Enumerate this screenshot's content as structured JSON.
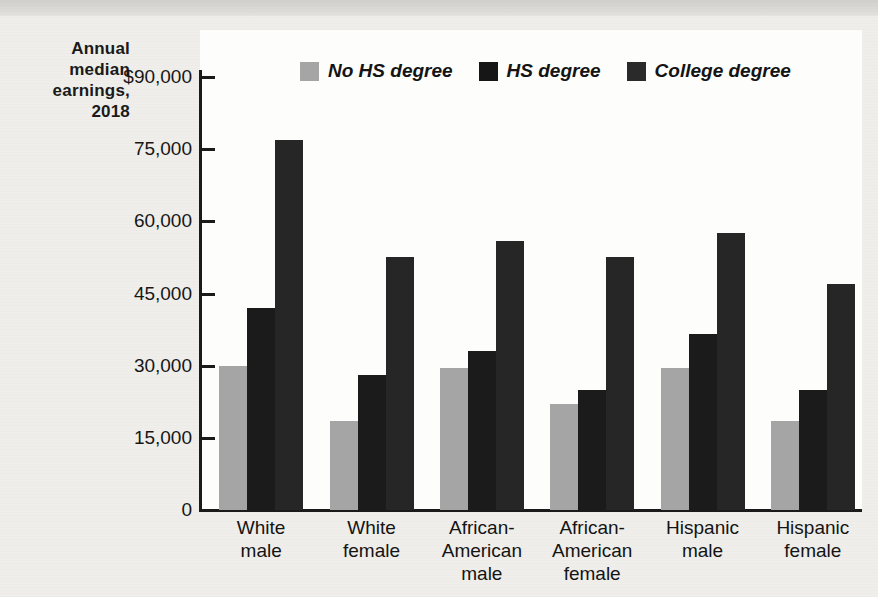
{
  "chart_data": {
    "type": "bar",
    "title": "",
    "xlabel": "",
    "ylabel": "Annual median earnings, 2018",
    "ylim": [
      0,
      90000
    ],
    "ytick_values": [
      0,
      15000,
      30000,
      45000,
      60000,
      75000,
      90000
    ],
    "ytick_labels": [
      "0",
      "15,000",
      "30,000",
      "45,000",
      "60,000",
      "75,000",
      "$90,000"
    ],
    "grid": false,
    "legend_position": "top-center",
    "categories": [
      "White male",
      "White female",
      "African-American male",
      "African-American female",
      "Hispanic male",
      "Hispanic female"
    ],
    "category_lines": [
      [
        "White",
        "male"
      ],
      [
        "White",
        "female"
      ],
      [
        "African-",
        "American",
        "male"
      ],
      [
        "African-",
        "American",
        "female"
      ],
      [
        "Hispanic",
        "male"
      ],
      [
        "Hispanic",
        "female"
      ]
    ],
    "series": [
      {
        "name": "No HS degree",
        "color": "#a5a5a5",
        "values": [
          30000,
          18500,
          29500,
          22000,
          29500,
          18500
        ]
      },
      {
        "name": "HS degree",
        "color": "#1b1b1b",
        "values": [
          42000,
          28000,
          33000,
          25000,
          36500,
          25000
        ]
      },
      {
        "name": "College degree",
        "color": "#262626",
        "values": [
          77000,
          52500,
          56000,
          52500,
          57500,
          47000
        ]
      }
    ]
  },
  "axis_title": {
    "line1": "Annual",
    "line2": "median",
    "line3": "earnings,",
    "line4": "2018"
  }
}
